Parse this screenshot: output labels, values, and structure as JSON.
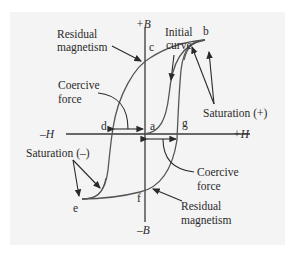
{
  "diagram": {
    "axes": {
      "pos_b": "+B",
      "neg_b": "–B",
      "pos_h": "+H",
      "neg_h": "–H"
    },
    "points": {
      "a": "a",
      "b": "b",
      "c": "c",
      "d": "d",
      "e": "e",
      "f": "f",
      "g": "g"
    },
    "annotations": {
      "residual_top_line1": "Residual",
      "residual_top_line2": "magnetism",
      "initial_line1": "Initial",
      "initial_line2": "curve",
      "coercive_left_line1": "Coercive",
      "coercive_left_line2": "force",
      "saturation_pos": "Saturation  (+)",
      "saturation_neg": "Saturation  (–)",
      "coercive_right_line1": "Coercive",
      "coercive_right_line2": "force",
      "residual_bottom_line1": "Residual",
      "residual_bottom_line2": "magnetism"
    },
    "colors": {
      "background": "#f4f4f4",
      "line": "#3a3a3a",
      "text": "#2a2a2a"
    }
  }
}
